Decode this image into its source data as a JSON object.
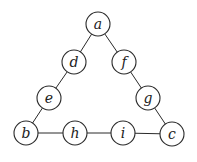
{
  "diagram": {
    "type": "graph",
    "title": "",
    "node_radius": 12,
    "nodes": [
      {
        "id": "a",
        "label": "a",
        "x": 98,
        "y": 24
      },
      {
        "id": "d",
        "label": "d",
        "x": 74,
        "y": 62
      },
      {
        "id": "f",
        "label": "f",
        "x": 124,
        "y": 62
      },
      {
        "id": "e",
        "label": "e",
        "x": 49,
        "y": 98
      },
      {
        "id": "g",
        "label": "g",
        "x": 148,
        "y": 98
      },
      {
        "id": "b",
        "label": "b",
        "x": 26,
        "y": 133
      },
      {
        "id": "h",
        "label": "h",
        "x": 75,
        "y": 133
      },
      {
        "id": "i",
        "label": "i",
        "x": 123,
        "y": 133
      },
      {
        "id": "c",
        "label": "c",
        "x": 172,
        "y": 134
      }
    ],
    "edges": [
      [
        "a",
        "d"
      ],
      [
        "d",
        "e"
      ],
      [
        "e",
        "b"
      ],
      [
        "a",
        "f"
      ],
      [
        "f",
        "g"
      ],
      [
        "g",
        "c"
      ],
      [
        "b",
        "h"
      ],
      [
        "h",
        "i"
      ],
      [
        "i",
        "c"
      ]
    ]
  }
}
